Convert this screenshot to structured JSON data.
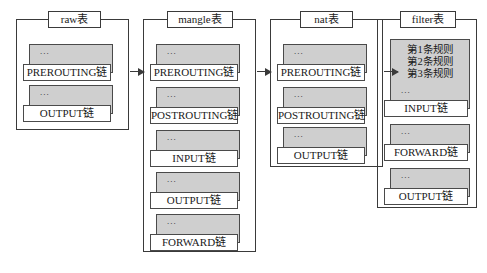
{
  "diagram": {
    "background_color": "#ffffff",
    "border_color": "#3a3a3a",
    "chain_fill_color": "#cfcfcf",
    "label_fill_color": "#ffffff",
    "ellipsis": "...",
    "tables": [
      {
        "id": "raw",
        "label": "raw表",
        "chains": [
          {
            "name": "PREROUTING链",
            "dots": "...",
            "rules": []
          },
          {
            "name": "OUTPUT链",
            "dots": "...",
            "rules": []
          }
        ]
      },
      {
        "id": "mangle",
        "label": "mangle表",
        "chains": [
          {
            "name": "PREROUTING链",
            "dots": "...",
            "rules": []
          },
          {
            "name": "POSTROUTING链",
            "dots": "...",
            "rules": []
          },
          {
            "name": "INPUT链",
            "dots": "...",
            "rules": []
          },
          {
            "name": "OUTPUT链",
            "dots": "...",
            "rules": []
          },
          {
            "name": "FORWARD链",
            "dots": "...",
            "rules": []
          }
        ]
      },
      {
        "id": "nat",
        "label": "nat表",
        "chains": [
          {
            "name": "PREROUTING链",
            "dots": "...",
            "rules": []
          },
          {
            "name": "POSTROUTING链",
            "dots": "...",
            "rules": []
          },
          {
            "name": "OUTPUT链",
            "dots": "...",
            "rules": []
          }
        ]
      },
      {
        "id": "filter",
        "label": "filter表",
        "chains": [
          {
            "name": "INPUT链",
            "dots": "...",
            "rules": [
              "第1条规则",
              "第2条规则",
              "第3条规则"
            ]
          },
          {
            "name": "FORWARD链",
            "dots": "...",
            "rules": []
          },
          {
            "name": "OUTPUT链",
            "dots": "...",
            "rules": []
          }
        ]
      }
    ],
    "connectors": [
      {
        "from": "raw",
        "to": "mangle"
      },
      {
        "from": "mangle",
        "to": "nat"
      },
      {
        "from": "nat",
        "to": "filter"
      }
    ]
  }
}
